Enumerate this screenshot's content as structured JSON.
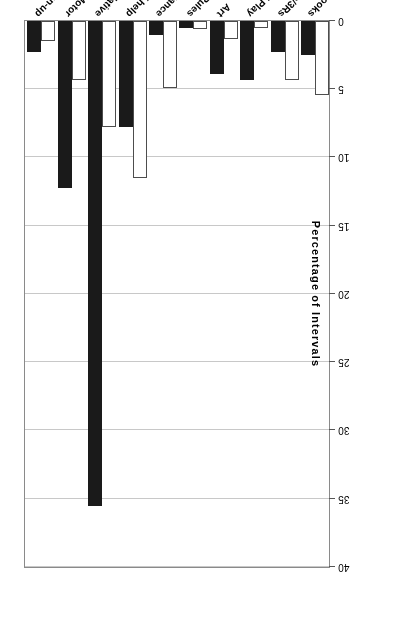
{
  "chart_data": {
    "type": "bar",
    "title": "",
    "xlabel": "",
    "ylabel": "Percentage of Intervals",
    "ylim": [
      0,
      40
    ],
    "yticks": [
      0,
      5,
      10,
      15,
      20,
      25,
      30,
      35,
      40
    ],
    "grid": true,
    "orientation": "vertical",
    "page_rotation_degrees": 180,
    "legend": "none",
    "categories": [
      "Books",
      "Preacademic/3Rs",
      "Pretend Play",
      "Art",
      "Game w/Rules",
      "Sing/Recite/Dance",
      "Self-help",
      "Manipulative",
      "Large Motor",
      "Clean-up"
    ],
    "series": [
      {
        "name": "open",
        "style": "white-fill-black-outline",
        "color": "#ffffff",
        "values": [
          5.4,
          4.3,
          0.5,
          1.3,
          0.6,
          4.9,
          11.5,
          7.8,
          4.3,
          1.5
        ]
      },
      {
        "name": "filled",
        "style": "black-fill",
        "color": "#1a1a1a",
        "values": [
          2.5,
          2.3,
          4.3,
          3.9,
          0.5,
          1.0,
          7.8,
          35.5,
          12.2,
          2.3
        ]
      }
    ]
  },
  "axis": {
    "y_title": "Percentage of Intervals",
    "tick_labels": [
      "0",
      "5",
      "10",
      "15",
      "20",
      "25",
      "30",
      "35",
      "40"
    ]
  }
}
